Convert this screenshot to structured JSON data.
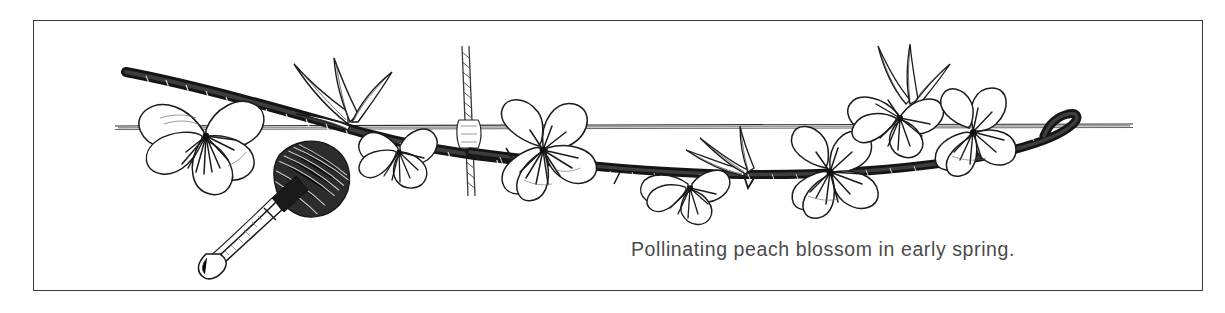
{
  "figure": {
    "caption": "Pollinating peach blossom in early spring.",
    "frame": {
      "border_color": "#3a3a3a",
      "background_color": "#ffffff"
    },
    "ink_color": "#111111",
    "caption_color": "#4a4a4a",
    "subject_labels": {
      "branch": "peach-branch",
      "brush": "pollinating-brush",
      "wire_horizontal": "horizontal-training-wire",
      "wire_vertical": "vertical-wire-stake",
      "blossom": "peach-blossom",
      "leaf": "peach-leaf"
    },
    "blossom_count": 6,
    "leaf_cluster_count": 3
  }
}
